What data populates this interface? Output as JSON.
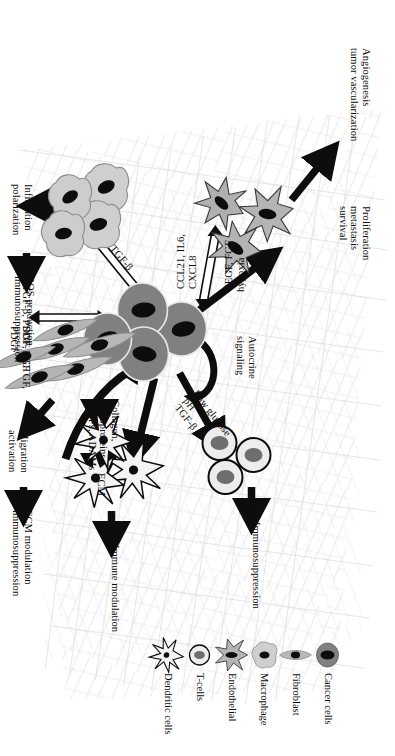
{
  "figure": {
    "title_present": false,
    "orientation": "rotated-90-landscape-content-in-portrait-frame",
    "background": "#ffffff",
    "texture": "faint grey cross-hatched scribble background behind the central region"
  },
  "colors": {
    "ink": "#0d0d0d",
    "cancer_cell_body": "#808080",
    "cancer_cell_nucleus": "#0d0d0d",
    "fibroblast_body": "#b3b3b3",
    "fibroblast_nucleus": "#0d0d0d",
    "macrophage_body": "#cccccc",
    "macrophage_nucleus": "#0d0d0d",
    "endothelial_body": "#b0b0b0",
    "endothelial_nucleus": "#0d0d0d",
    "tcell_body": "#ededed",
    "tcell_nucleus": "#6e6e6e",
    "dendritic_body": "#f2f2f2",
    "dendritic_nucleus": "#0d0d0d",
    "arrow_solid": "#0d0d0d",
    "arrow_outline_fill": "#ffffff",
    "arrow_outline_stroke": "#0d0d0d",
    "texture_grey": "#dcdcdc"
  },
  "cell_types": {
    "cancer": "Cancer cells",
    "fibroblast": "Fibroblast",
    "macrophage": "Macrophage",
    "endothelial": "Endothelial",
    "tcell": "T-cells",
    "dendritic": "Dendritic cells"
  },
  "labels": {
    "angiogenesis": "Angiogenesis\ntumor vascularization",
    "proliferation": "Proliferation\nmetastasis\nsurvival",
    "autocrine": "Autocrine\nsignaling",
    "immunosuppression_tcell": "Immunosuppression",
    "immune_modulation": "Immune modulation",
    "vegf_fgf": "VEGF, FGF\nhypoxia",
    "ccl21": "CCL21, IL6,\nCXCL8",
    "low_glucose": "Low glucose\npH\nTGF-β",
    "tgfb": "TGF-β",
    "tgfb_pdgf_fgf": "TGF-β, PDGF, FGF",
    "sdf1_ctgf_pdgf": "SDF-1, CTGF,\nPDGF",
    "infiltration": "Infiltration\npolarization",
    "ros": "ROS production\nimmunosuppression",
    "collagen": "Collagen,\nglycoproteins,\nMMPs, ADAMs",
    "ecm": "ECM",
    "migration": "Migration\nactivation",
    "ecm_modulation": "ECM modulation\nimmunosuppression"
  },
  "nodes": [
    {
      "id": "cancer-cluster",
      "type": "Cancer cells",
      "count": 4,
      "role": "central tumour cell cluster"
    },
    {
      "id": "endothelial-cluster",
      "type": "Endothelial",
      "count": 3,
      "role": "vasculature, upper left of centre"
    },
    {
      "id": "macrophage-cluster",
      "type": "Macrophage",
      "count": 4,
      "role": "lower left of centre"
    },
    {
      "id": "fibroblast-cluster",
      "type": "Fibroblast",
      "count": 6,
      "role": "cancer associated fibroblasts, lower centre"
    },
    {
      "id": "tcell-cluster",
      "type": "T-cells",
      "count": 3,
      "role": "upper right of centre"
    },
    {
      "id": "dendritic-cluster",
      "type": "Dendritic cells",
      "count": 3,
      "role": "lower right of centre"
    }
  ],
  "edges": [
    {
      "id": "e-cancer-endothelial",
      "from": "cancer-cluster",
      "to": "endothelial-cluster",
      "label": "VEGF, FGF\nhypoxia",
      "style": "outline-double-arrow"
    },
    {
      "id": "e-endothelial-cancer",
      "from": "endothelial-cluster",
      "to": "cancer-cluster",
      "label": "CCL21, IL6,\nCXCL8",
      "style": "outline-double-arrow"
    },
    {
      "id": "e-endothelial-out",
      "from": "endothelial-cluster",
      "to": "angiogenesis",
      "label": "Angiogenesis\ntumor vascularization",
      "style": "solid-arrow"
    },
    {
      "id": "e-cancer-prolif",
      "from": "cancer-cluster",
      "to": "proliferation",
      "label": "Proliferation\nmetastasis\nsurvival",
      "style": "solid-arrow"
    },
    {
      "id": "e-cancer-autocrine",
      "from": "cancer-cluster",
      "to": "cancer-cluster",
      "label": "Autocrine\nsignaling",
      "style": "curved-self-loop"
    },
    {
      "id": "e-cancer-tcell",
      "from": "cancer-cluster",
      "to": "tcell-cluster",
      "label": "Low glucose\npH\nTGF-β",
      "style": "solid-arrow"
    },
    {
      "id": "e-tcell-out",
      "from": "tcell-cluster",
      "to": "immunosuppression",
      "label": "Immunosuppression",
      "style": "solid-arrow"
    },
    {
      "id": "e-cancer-dendritic",
      "from": "cancer-cluster",
      "to": "dendritic-cluster",
      "label": "",
      "style": "solid-arrow"
    },
    {
      "id": "e-dendritic-out",
      "from": "dendritic-cluster",
      "to": "immune-modulation",
      "label": "Immune modulation",
      "style": "solid-arrow"
    },
    {
      "id": "e-cancer-macrophage",
      "from": "cancer-cluster",
      "to": "macrophage-cluster",
      "label": "TGF-β",
      "style": "outline-double-arrow"
    },
    {
      "id": "e-macrophage-out",
      "from": "macrophage-cluster",
      "to": "infiltration",
      "label": "Infiltration\npolarization",
      "style": "solid-arrow"
    },
    {
      "id": "e-infiltration-ros",
      "from": "infiltration",
      "to": "ros",
      "label": "ROS production\nimmunosuppression",
      "style": "solid-arrow"
    },
    {
      "id": "e-cancer-fibroblast",
      "from": "cancer-cluster",
      "to": "fibroblast-cluster",
      "label": "TGF-β, PDGF, FGF",
      "style": "outline-double-arrow"
    },
    {
      "id": "e-fibroblast-cancer",
      "from": "fibroblast-cluster",
      "to": "cancer-cluster",
      "label": "SDF-1, CTGF,\nPDGF",
      "style": "outline-double-arrow"
    },
    {
      "id": "e-fibroblast-ecm",
      "from": "fibroblast-cluster",
      "to": "ecm",
      "label": "Collagen,\nglycoproteins,\nMMPs, ADAMs",
      "style": "solid-arrow"
    },
    {
      "id": "e-ecm-cancer",
      "from": "ecm",
      "to": "cancer-cluster",
      "label": "ECM",
      "style": "curved-thick-arrow"
    },
    {
      "id": "e-fibroblast-migration",
      "from": "fibroblast-cluster",
      "to": "migration",
      "label": "Migration\nactivation",
      "style": "solid-arrow"
    },
    {
      "id": "e-migration-ecmmod",
      "from": "migration",
      "to": "ecm-modulation",
      "label": "ECM modulation\nimmunosuppression",
      "style": "solid-arrow"
    }
  ],
  "legend": {
    "items": [
      {
        "label": "Cancer cells",
        "icon": "cancer-cell-icon"
      },
      {
        "label": "Fibroblast",
        "icon": "fibroblast-icon"
      },
      {
        "label": "Macrophage",
        "icon": "macrophage-icon"
      },
      {
        "label": "Endothelial",
        "icon": "endothelial-icon"
      },
      {
        "label": "T-cells",
        "icon": "tcell-icon"
      },
      {
        "label": "Dendritic cells",
        "icon": "dendritic-cell-icon"
      }
    ]
  }
}
